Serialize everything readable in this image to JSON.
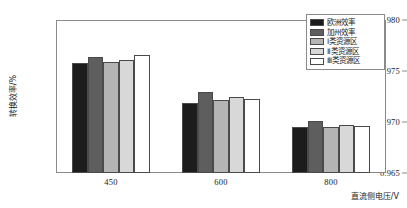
{
  "chart_data": {
    "type": "bar",
    "title": "",
    "xlabel": "直流侧电压/V",
    "ylabel": "转换效率/%",
    "categories": [
      "450",
      "600",
      "800"
    ],
    "ylim": [
      0.965,
      0.98
    ],
    "yticks": [
      "0.980",
      "0.975",
      "0.970",
      "0.965"
    ],
    "ytick_values": [
      0.98,
      0.975,
      0.97,
      0.965
    ],
    "grid": false,
    "legend_position": "top-right",
    "series": [
      {
        "name": "欧洲效率",
        "color": "#1c1c1c",
        "values": [
          0.9758,
          0.9719,
          0.9695
        ]
      },
      {
        "name": "加州效率",
        "color": "#5e5e5e",
        "values": [
          0.9764,
          0.9729,
          0.9701
        ]
      },
      {
        "name": "Ⅰ类资源区",
        "color": "#b4b4b4",
        "values": [
          0.9759,
          0.9722,
          0.9695
        ]
      },
      {
        "name": "Ⅱ类资源区",
        "color": "#d8d8d8",
        "values": [
          0.9761,
          0.9725,
          0.9697
        ]
      },
      {
        "name": "Ⅲ类资源区",
        "color": "#ffffff",
        "values": [
          0.9766,
          0.9723,
          0.9696
        ]
      }
    ]
  },
  "axes": {
    "frame_color": "#8a8a8a",
    "text_color": "#1a1a1a"
  }
}
